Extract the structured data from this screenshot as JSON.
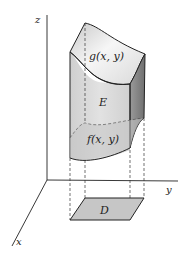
{
  "figure": {
    "axes": {
      "z_label": "z",
      "y_label": "y",
      "x_label": "x"
    },
    "labels": {
      "top_surface": "g(x, y)",
      "solid": "E",
      "bottom_surface": "f(x, y)",
      "base_region": "D"
    },
    "colors": {
      "line": "#222222",
      "top_surface_light": "#f4f4f4",
      "top_surface_dark": "#bdbdbd",
      "front_face": "#d6d6d6",
      "side_face": "#8a8a8a",
      "bottom_surface": "#c8c8c8",
      "base_region": "#c6c6c6"
    }
  }
}
